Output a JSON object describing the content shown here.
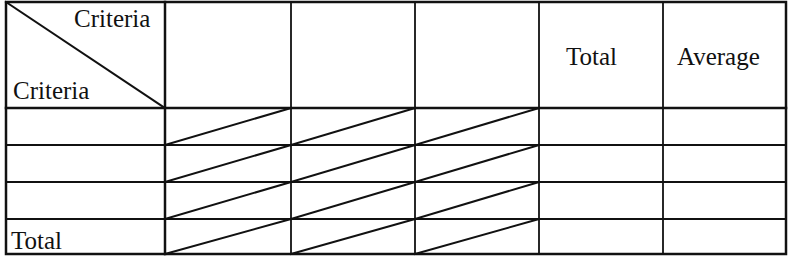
{
  "table": {
    "corner_header": {
      "top_right_label": "Criteria",
      "bottom_left_label": "Criteria"
    },
    "column_headers": [
      "",
      "",
      "",
      "Total",
      "Average"
    ],
    "row_headers": [
      "",
      "",
      "",
      "Total"
    ],
    "cells": [
      [
        "",
        "",
        "",
        "",
        ""
      ],
      [
        "",
        "",
        "",
        "",
        ""
      ],
      [
        "",
        "",
        "",
        "",
        ""
      ],
      [
        "",
        "",
        "",
        "",
        ""
      ]
    ],
    "struck_through_columns": [
      0,
      1,
      2
    ],
    "line_color": "#111111",
    "background_color": "#ffffff"
  }
}
